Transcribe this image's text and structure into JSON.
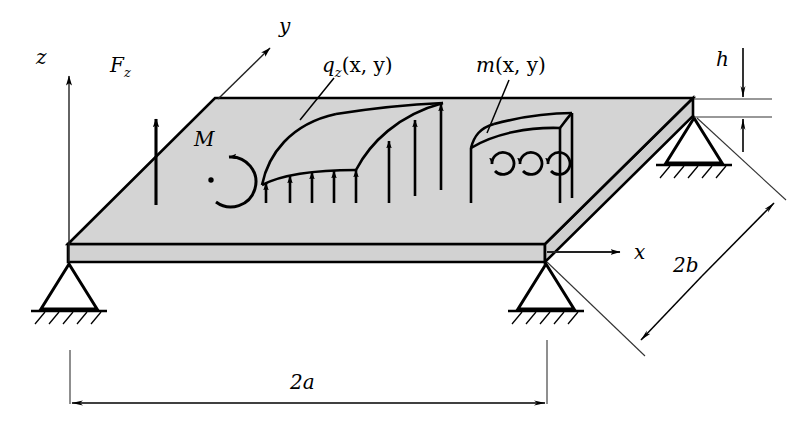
{
  "figure": {
    "title_present": false,
    "background_color": "#ffffff",
    "stroke_color": "#000000",
    "plate_fill": "#d4d4d4",
    "plate_edge_fill": "#d0d0d0",
    "thin_line_color": "#1a1a1a"
  },
  "axes": {
    "z": {
      "label": "z",
      "direction": "up"
    },
    "y": {
      "label": "y",
      "direction": "up-right"
    },
    "x": {
      "label": "x",
      "direction": "right"
    }
  },
  "loads": {
    "point_force": {
      "label": "F",
      "subscript": "z"
    },
    "moment": {
      "label": "M"
    },
    "distributed_load": {
      "label": "q",
      "subscript": "z",
      "args": "(x, y)"
    },
    "distributed_moment": {
      "label": "m",
      "args": "(x, y)"
    }
  },
  "dimensions": {
    "span_x": "2a",
    "span_y": "2b",
    "thickness": "h"
  },
  "supports": {
    "count": 3,
    "type": "pinned-hatched",
    "names": [
      "support-front-left",
      "support-front-right",
      "support-back-right"
    ]
  },
  "geometry": {
    "plate_top": [
      [
        68,
        244
      ],
      [
        215,
        98
      ],
      [
        693,
        98
      ],
      [
        545,
        244
      ]
    ],
    "plate_front_face": [
      [
        68,
        244
      ],
      [
        545,
        244
      ],
      [
        545,
        262
      ],
      [
        68,
        262
      ]
    ],
    "plate_right_face": [
      [
        545,
        244
      ],
      [
        693,
        98
      ],
      [
        693,
        116
      ],
      [
        545,
        262
      ]
    ],
    "q_front_arrow_x": [
      266,
      290,
      312,
      334,
      356
    ],
    "q_back_arrow_x": [
      389,
      415,
      440
    ],
    "q_arrow_baseline_y": 203,
    "m_arrow_x": [
      487,
      515,
      542
    ]
  }
}
